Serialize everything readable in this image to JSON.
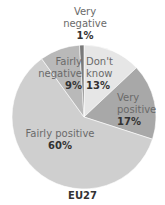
{
  "chart_data": {
    "type": "pie",
    "title": "EU27",
    "start_angle_deg": 0,
    "direction": "clockwise",
    "slices": [
      {
        "label": "Don't know",
        "value": 13,
        "display": "13%",
        "color": "#e6e6e6"
      },
      {
        "label": "Very positive",
        "value": 17,
        "display": "17%",
        "color": "#a8a8a8"
      },
      {
        "label": "Fairly positive",
        "value": 60,
        "display": "60%",
        "color": "#cfcfcf"
      },
      {
        "label": "Fairly negative",
        "value": 9,
        "display": "9%",
        "color": "#b9b9b9"
      },
      {
        "label": "Very negative",
        "value": 1,
        "display": "1%",
        "color": "#7a7a7a"
      }
    ]
  },
  "labels": {
    "very_negative_1": "Very",
    "very_negative_2": "negative",
    "very_negative_pct": "1%",
    "fairly_negative_1": "Fairly",
    "fairly_negative_2": "negative",
    "fairly_negative_pct": "9%",
    "dont_know_1": "Don't",
    "dont_know_2": "know",
    "dont_know_pct": "13%",
    "very_positive_1": "Very",
    "very_positive_2": "positive",
    "very_positive_pct": "17%",
    "fairly_positive_1": "Fairly positive",
    "fairly_positive_pct": "60%",
    "title": "EU27"
  }
}
